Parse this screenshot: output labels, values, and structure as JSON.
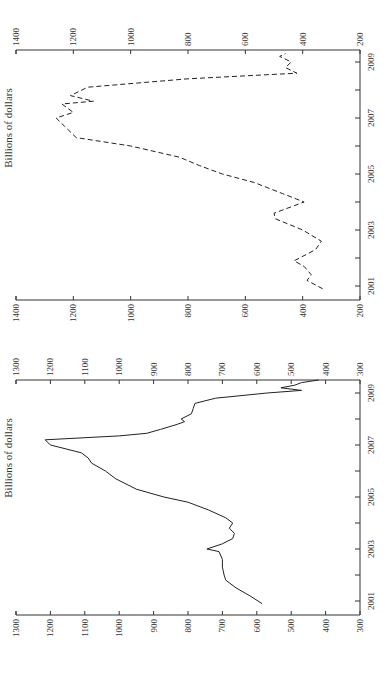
{
  "chart_data": [
    {
      "type": "line",
      "title": "",
      "line_style": "dashed",
      "xlabel": "",
      "ylabel": "Billions of dollars",
      "ylim": [
        200,
        1400
      ],
      "yticks": [
        200,
        400,
        600,
        800,
        1000,
        1200,
        1400
      ],
      "ytick_labels_left": [
        "200",
        "400",
        "600",
        "800",
        "1000",
        "1200",
        "1400"
      ],
      "ytick_labels_right": [
        "200",
        "400",
        "600",
        "800",
        "1000",
        "1200",
        "1400"
      ],
      "xlim": [
        2000.6,
        2009.8
      ],
      "xticks": [
        2001,
        2002,
        2003,
        2004,
        2005,
        2006,
        2007,
        2008,
        2009
      ],
      "xtick_labels": [
        "2001",
        "",
        "2003",
        "",
        "2005",
        "",
        "2007",
        "",
        "2009"
      ],
      "grid": false,
      "rotation": "rotated 90 degrees counter-clockwise on page",
      "x": [
        2000.9,
        2001.2,
        2001.4,
        2001.7,
        2001.9,
        2002.3,
        2002.6,
        2003.0,
        2003.4,
        2003.6,
        2004.0,
        2004.3,
        2004.7,
        2005.0,
        2005.3,
        2005.6,
        2006.0,
        2006.3,
        2006.7,
        2007.0,
        2007.2,
        2007.5,
        2007.6,
        2007.8,
        2008.1,
        2008.4,
        2008.6,
        2008.8,
        2009.0,
        2009.2,
        2009.3
      ],
      "values": [
        330,
        385,
        370,
        395,
        430,
        355,
        335,
        400,
        495,
        500,
        395,
        470,
        570,
        680,
        760,
        830,
        1000,
        1190,
        1230,
        1260,
        1200,
        1240,
        1130,
        1210,
        1150,
        800,
        420,
        460,
        440,
        480,
        460
      ]
    },
    {
      "type": "line",
      "title": "",
      "line_style": "solid",
      "xlabel": "",
      "ylabel": "Billions of dollars",
      "ylim": [
        300,
        1300
      ],
      "yticks": [
        300,
        400,
        500,
        600,
        700,
        800,
        900,
        1000,
        1100,
        1200,
        1300
      ],
      "ytick_labels_left": [
        "300",
        "400",
        "500",
        "600",
        "700",
        "800",
        "900",
        "1000",
        "1100",
        "1200",
        "1300"
      ],
      "ytick_labels_right": [
        "300",
        "400",
        "500",
        "600",
        "700",
        "800",
        "900",
        "1000",
        "1100",
        "1200",
        "1300"
      ],
      "xlim": [
        2000.6,
        2009.8
      ],
      "xticks": [
        2001,
        2002,
        2003,
        2004,
        2005,
        2006,
        2007,
        2008,
        2009
      ],
      "xtick_labels": [
        "2001",
        "",
        "2003",
        "",
        "2005",
        "",
        "2007",
        "",
        "2009"
      ],
      "grid": false,
      "rotation": "rotated 90 degrees counter-clockwise on page",
      "x": [
        2000.9,
        2001.2,
        2001.5,
        2001.8,
        2002.0,
        2002.3,
        2002.6,
        2002.9,
        2003.0,
        2003.2,
        2003.4,
        2003.6,
        2003.8,
        2004.0,
        2004.2,
        2004.5,
        2004.8,
        2005.0,
        2005.3,
        2005.7,
        2006.0,
        2006.3,
        2006.5,
        2006.7,
        2006.8,
        2007.0,
        2007.2,
        2007.35,
        2007.45,
        2007.6,
        2007.8,
        2007.9,
        2008.0,
        2008.2,
        2008.4,
        2008.6,
        2008.8,
        2009.0,
        2009.1,
        2009.2,
        2009.3,
        2009.4,
        2009.5
      ],
      "values": [
        585,
        620,
        660,
        690,
        695,
        700,
        700,
        710,
        745,
        700,
        670,
        665,
        680,
        670,
        690,
        740,
        800,
        870,
        950,
        1010,
        1040,
        1080,
        1090,
        1110,
        1140,
        1200,
        1215,
        1000,
        920,
        880,
        830,
        810,
        820,
        790,
        785,
        780,
        720,
        570,
        470,
        530,
        490,
        470,
        420
      ]
    }
  ],
  "charts": [
    {
      "ylabel": "Billions of dollars"
    },
    {
      "ylabel": "Billions of dollars"
    }
  ],
  "colors": {
    "axis": "#333333",
    "line": "#222222",
    "background": "#ffffff"
  }
}
